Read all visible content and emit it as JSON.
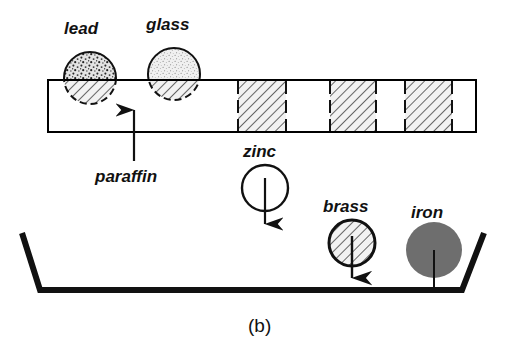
{
  "figure": {
    "caption": "(b)",
    "container_label": "trough",
    "slab_label": "paraffin"
  },
  "labels": {
    "lead": "lead",
    "glass": "glass",
    "paraffin": "paraffin",
    "zinc": "zinc",
    "brass": "brass",
    "iron": "iron"
  },
  "colors": {
    "ink": "#111111",
    "line": "#000000",
    "iron_fill": "#6e6e6e",
    "lead_fill": "#d9d9d9",
    "glass_fill": "#ececec",
    "hatch_fill": "#efefef",
    "white": "#ffffff",
    "background": "#ffffff"
  },
  "objects": [
    {
      "name": "lead",
      "label": "lead",
      "state": "floating-partly-submerged",
      "fill": "speckle-coarse",
      "cx": 90,
      "cy": 78,
      "r": 26
    },
    {
      "name": "glass",
      "label": "glass",
      "state": "floating-partly-submerged",
      "fill": "speckle-fine",
      "cx": 174,
      "cy": 74,
      "r": 26
    },
    {
      "name": "zinc",
      "label": "zinc",
      "state": "sinking",
      "fill": "white",
      "cx": 265,
      "cy": 188,
      "r": 23,
      "arrow": "down"
    },
    {
      "name": "brass",
      "label": "brass",
      "state": "sinking",
      "fill": "hatch",
      "cx": 352,
      "cy": 243,
      "r": 23,
      "arrow": "down"
    },
    {
      "name": "iron",
      "label": "iron",
      "state": "resting-on-floor",
      "fill": "solid-gray",
      "cx": 434,
      "cy": 250,
      "r": 28,
      "arrow": "line-to-floor"
    }
  ],
  "slab": {
    "label": "paraffin",
    "x": 48,
    "y": 80,
    "width": 428,
    "height": 52,
    "blocks": [
      {
        "x": 238,
        "width": 48
      },
      {
        "x": 330,
        "width": 46
      },
      {
        "x": 405,
        "width": 47
      }
    ],
    "block_fill": "diagonal-hatch",
    "block_edge": "dashed"
  },
  "trough": {
    "floor_y": 290,
    "floor_x1": 40,
    "floor_x2": 462,
    "left_wall_top_x": 22,
    "right_wall_top_x": 484,
    "wall_top_y": 233
  }
}
